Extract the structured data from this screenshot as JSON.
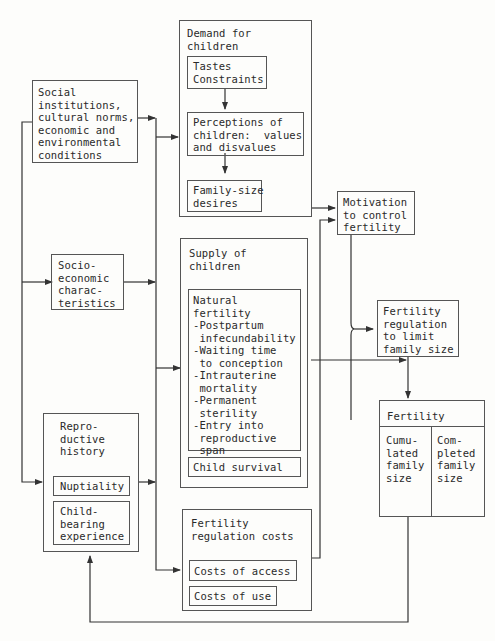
{
  "diagram": {
    "left_column": {
      "social": {
        "label": "Social\ninstitutions,\ncultural norms,\neconomic and\nenvironmental\nconditions"
      },
      "socioeconomic": {
        "label": "Socio-\neconomic\ncharac-\nteristics"
      },
      "reproductive_history": {
        "label": "Repro-\nductive\nhistory",
        "items": [
          "Nuptiality",
          "Child-\nbearing\nexperience"
        ]
      }
    },
    "middle_column": {
      "demand": {
        "label": "Demand for\nchildren",
        "items": [
          "Tastes\nConstraints",
          "Perceptions of\nchildren:  values\nand disvalues",
          "Family-size\ndesires"
        ]
      },
      "supply": {
        "label": "Supply of\nchildren",
        "natural_fertility": "Natural\nfertility\n-Postpartum\n infecundability\n-Waiting time\n to conception\n-Intrauterine\n mortality\n-Permanent\n sterility\n-Entry into\n reproductive\n span",
        "child_survival": "Child survival"
      },
      "regulation_costs": {
        "label": "Fertility\nregulation costs",
        "items": [
          "Costs of access",
          "Costs of use"
        ]
      }
    },
    "right_column": {
      "motivation": {
        "label": "Motivation\nto control\nfertility"
      },
      "regulation": {
        "label": "Fertility\nregulation\nto limit\nfamily size"
      },
      "fertility": {
        "label": "Fertility",
        "cells": [
          "Cumu-\nlated\nfamily\nsize",
          "Com-\npleted\nfamily\nsize"
        ]
      }
    }
  },
  "colors": {
    "line": "#333333",
    "box_border": "#555555",
    "background": "#fdfdfb"
  }
}
